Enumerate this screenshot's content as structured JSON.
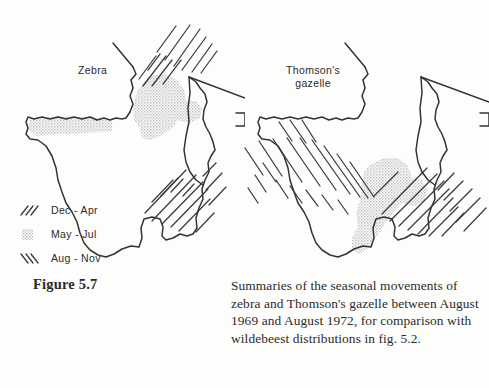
{
  "figure": {
    "number_label": "Figure 5.7",
    "caption": "Summaries of the seasonal movements of zebra and Thomson's gazelle between August 1969 and August 1972, for comparison with wildebeest distributions in fig. 5.2."
  },
  "maps": [
    {
      "id": "zebra",
      "species_label": "Zebra",
      "seasons_shown": [
        "Dec - Apr",
        "May - Jul"
      ]
    },
    {
      "id": "gazelle",
      "species_label": "Thomson's\ngazelle",
      "seasons_shown": [
        "Dec - Apr",
        "May - Jul",
        "Aug - Nov"
      ]
    }
  ],
  "legend": {
    "items": [
      {
        "key": "dec-apr",
        "label": "Dec - Apr",
        "pattern": "forward-hatch",
        "color": "#2b2b2b"
      },
      {
        "key": "may-jul",
        "label": "May - Jul",
        "pattern": "stipple",
        "color": "#b9b9b9"
      },
      {
        "key": "aug-nov",
        "label": "Aug - Nov",
        "pattern": "back-hatch",
        "color": "#2b2b2b"
      }
    ]
  },
  "colors": {
    "page_background": "#fdfdfc",
    "ink": "#2b2b2b",
    "outline": "#333333",
    "stipple_gray": "#c8c8c8"
  }
}
